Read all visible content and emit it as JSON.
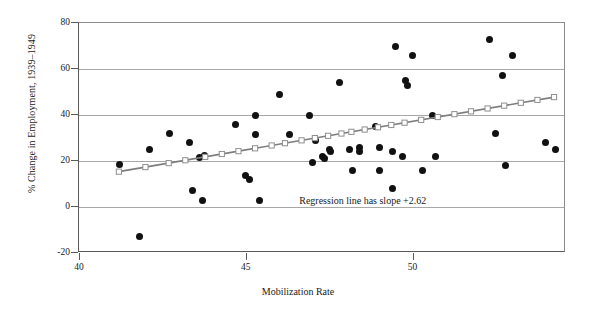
{
  "chart_data": {
    "type": "scatter",
    "title": "",
    "xlabel": "Mobilization Rate",
    "ylabel": "% Change in Employment, 1939–1949",
    "xlim": [
      40,
      54.6
    ],
    "ylim": [
      -20,
      80
    ],
    "xticks": [
      40,
      45,
      50,
      55
    ],
    "yticks": [
      80,
      60,
      40,
      20,
      0,
      -20
    ],
    "grid": true,
    "legend": "none",
    "annotations": [
      {
        "text": "Regression line has slope +2.62",
        "x": 49.6,
        "y": 2
      }
    ],
    "series": [
      {
        "name": "States",
        "type": "scatter",
        "marker": "filled-circle",
        "color": "#111111",
        "points": [
          [
            41.2,
            18.6
          ],
          [
            41.8,
            -13.0
          ],
          [
            42.1,
            25.0
          ],
          [
            42.7,
            32.0
          ],
          [
            43.3,
            28.0
          ],
          [
            43.4,
            7.0
          ],
          [
            43.6,
            21.5
          ],
          [
            43.7,
            3.0
          ],
          [
            43.75,
            22.5
          ],
          [
            44.7,
            36.0
          ],
          [
            45.0,
            13.5
          ],
          [
            45.1,
            12.0
          ],
          [
            45.3,
            40.0
          ],
          [
            45.3,
            31.5
          ],
          [
            45.4,
            3.0
          ],
          [
            46.0,
            49.0
          ],
          [
            46.3,
            31.5
          ],
          [
            46.9,
            40.0
          ],
          [
            47.0,
            19.5
          ],
          [
            47.1,
            29.0
          ],
          [
            47.3,
            22.0
          ],
          [
            47.35,
            21.0
          ],
          [
            47.5,
            25.0
          ],
          [
            47.55,
            24.0
          ],
          [
            47.8,
            54.0
          ],
          [
            48.1,
            25.0
          ],
          [
            48.2,
            16.0
          ],
          [
            48.4,
            26.0
          ],
          [
            48.4,
            24.0
          ],
          [
            48.9,
            35.0
          ],
          [
            49.0,
            26.0
          ],
          [
            49.0,
            16.0
          ],
          [
            49.4,
            24.0
          ],
          [
            49.4,
            8.0
          ],
          [
            49.5,
            70.0
          ],
          [
            49.7,
            22.0
          ],
          [
            49.8,
            55.0
          ],
          [
            49.85,
            53.0
          ],
          [
            50.0,
            66.0
          ],
          [
            50.3,
            16.0
          ],
          [
            50.6,
            40.0
          ],
          [
            50.7,
            22.0
          ],
          [
            52.3,
            73.0
          ],
          [
            52.5,
            32.0
          ],
          [
            52.7,
            57.0
          ],
          [
            52.8,
            18.0
          ],
          [
            53.0,
            66.0
          ],
          [
            54.0,
            28.0
          ],
          [
            54.3,
            25.0
          ]
        ]
      },
      {
        "name": "Regression line",
        "type": "line",
        "marker": "open-square",
        "color": "#7d7d7d",
        "slope": 2.62,
        "endpoints": [
          [
            41.2,
            14.8
          ],
          [
            54.3,
            47.5
          ]
        ],
        "marker_x": [
          41.2,
          42.0,
          42.7,
          43.2,
          43.8,
          44.3,
          44.8,
          45.3,
          45.8,
          46.2,
          46.7,
          47.1,
          47.5,
          47.9,
          48.2,
          48.6,
          49.0,
          49.4,
          49.8,
          50.3,
          50.8,
          51.3,
          51.8,
          52.3,
          52.8,
          53.3,
          53.8,
          54.3
        ]
      }
    ]
  }
}
